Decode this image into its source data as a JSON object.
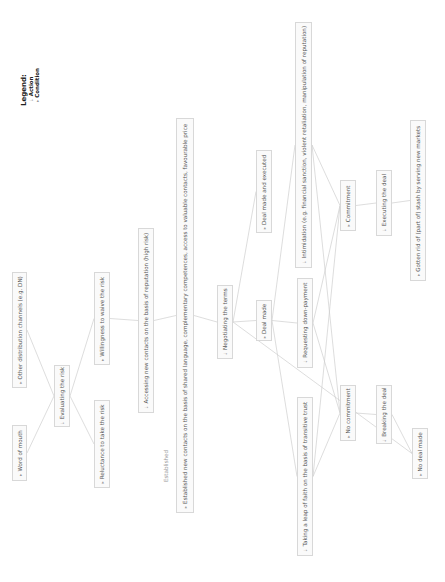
{
  "legend": {
    "title": "Legend:",
    "items": [
      {
        "label": "Action",
        "marker": "⇣"
      },
      {
        "label": "Condition",
        "marker": "▸"
      }
    ]
  },
  "free_labels": {
    "established": "Established"
  },
  "nodes": [
    {
      "id": "other_channels",
      "label": "Other distribution channels (e.g. DN)",
      "type": "condition",
      "marker": "▸",
      "box": [
        12,
        272,
        15,
        116
      ]
    },
    {
      "id": "word_of_mouth",
      "label": "Word of mouth",
      "type": "condition",
      "marker": "▸",
      "box": [
        12,
        425,
        15,
        56
      ]
    },
    {
      "id": "evaluating_risk",
      "label": "Evaluating the risk",
      "type": "action",
      "marker": "⇣",
      "box": [
        54,
        365,
        16,
        62
      ]
    },
    {
      "id": "willingness",
      "label": "Willingness to waive the risk",
      "type": "condition",
      "marker": "▸",
      "box": [
        94,
        272,
        16,
        93
      ]
    },
    {
      "id": "reluctance",
      "label": "Reluctance to take the risk",
      "type": "condition",
      "marker": "▸",
      "box": [
        94,
        400,
        16,
        88
      ]
    },
    {
      "id": "accessing_contacts",
      "label": "Accessing new contacts on the basis of reputation (high risk)",
      "type": "action",
      "marker": "⇣",
      "box": [
        138,
        228,
        16,
        185
      ]
    },
    {
      "id": "established_contacts",
      "label": "Established new contacts on the basis of shared language, complementary competences, access to valuable contacts, favourable price",
      "type": "condition",
      "marker": "▸",
      "box": [
        176,
        118,
        18,
        395
      ]
    },
    {
      "id": "negotiating",
      "label": "Negotiating the terms",
      "type": "action",
      "marker": "⇣",
      "box": [
        217,
        285,
        16,
        74
      ]
    },
    {
      "id": "deal_executed",
      "label": "Deal made and executed",
      "type": "condition",
      "marker": "▸",
      "box": [
        256,
        150,
        16,
        83
      ]
    },
    {
      "id": "deal_made",
      "label": "Deal made",
      "type": "condition",
      "marker": "▸",
      "box": [
        256,
        300,
        16,
        41
      ]
    },
    {
      "id": "intimidation",
      "label": "Intimidation (e.g. financial sanction, violent retaliation, manipulation of reputation)",
      "type": "action",
      "marker": "⇣",
      "box": [
        295,
        22,
        17,
        246
      ]
    },
    {
      "id": "down_payment",
      "label": "Requesting down-payment",
      "type": "action",
      "marker": "⇣",
      "box": [
        297,
        278,
        16,
        90
      ]
    },
    {
      "id": "leap_of_faith",
      "label": "Taking a leap of faith on the basis of transitive trust",
      "type": "action",
      "marker": "⇣",
      "box": [
        297,
        397,
        16,
        159
      ]
    },
    {
      "id": "commitment",
      "label": "Commitment",
      "type": "condition",
      "marker": "▸",
      "box": [
        340,
        180,
        16,
        51
      ]
    },
    {
      "id": "no_commitment",
      "label": "No commitment",
      "type": "condition",
      "marker": "▸",
      "box": [
        340,
        385,
        16,
        56
      ]
    },
    {
      "id": "executing",
      "label": "Executing the deal",
      "type": "action",
      "marker": "⇣",
      "box": [
        376,
        170,
        16,
        66
      ]
    },
    {
      "id": "breaking",
      "label": "Breaking the deal",
      "type": "action",
      "marker": "⇣",
      "box": [
        376,
        385,
        16,
        59
      ]
    },
    {
      "id": "stash",
      "label": "Gotten rid of (part of) stash by serving new markets",
      "type": "condition",
      "marker": "▸",
      "box": [
        410,
        120,
        16,
        161
      ]
    },
    {
      "id": "no_deal",
      "label": "No deal made",
      "type": "condition",
      "marker": "▸",
      "box": [
        412,
        428,
        16,
        51
      ]
    }
  ],
  "edges": [
    [
      "other_channels",
      "evaluating_risk"
    ],
    [
      "word_of_mouth",
      "evaluating_risk"
    ],
    [
      "evaluating_risk",
      "willingness"
    ],
    [
      "evaluating_risk",
      "reluctance"
    ],
    [
      "willingness",
      "accessing_contacts"
    ],
    [
      "accessing_contacts",
      "established_contacts"
    ],
    [
      "established_contacts",
      "negotiating"
    ],
    [
      "negotiating",
      "deal_executed"
    ],
    [
      "negotiating",
      "deal_made"
    ],
    [
      "negotiating",
      "no_deal"
    ],
    [
      "deal_made",
      "intimidation"
    ],
    [
      "deal_made",
      "down_payment"
    ],
    [
      "deal_made",
      "leap_of_faith"
    ],
    [
      "intimidation",
      "commitment"
    ],
    [
      "intimidation",
      "no_commitment"
    ],
    [
      "down_payment",
      "commitment"
    ],
    [
      "down_payment",
      "no_commitment"
    ],
    [
      "leap_of_faith",
      "commitment"
    ],
    [
      "leap_of_faith",
      "no_commitment"
    ],
    [
      "commitment",
      "executing"
    ],
    [
      "no_commitment",
      "breaking"
    ],
    [
      "executing",
      "stash"
    ],
    [
      "breaking",
      "no_deal"
    ]
  ],
  "colors": {
    "line": "#cfcfcf",
    "box_border": "#d8d8d8",
    "box_fill": "#fafafa",
    "text": "#555555"
  }
}
